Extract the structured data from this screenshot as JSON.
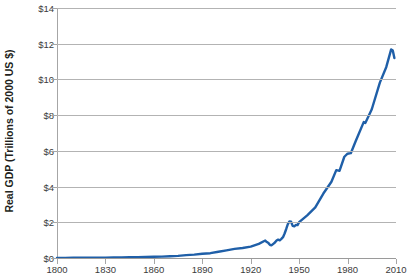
{
  "chart_data": {
    "type": "line",
    "title": "",
    "xlabel": "",
    "ylabel": "Real GDP (Trillions of 2000 US $)",
    "xlim": [
      1800,
      2010
    ],
    "ylim": [
      0,
      14
    ],
    "grid": true,
    "legend": "none",
    "line_color": "#1f5fa8",
    "gridline_color": "#b3b3b3",
    "axis_color": "#a6a6a6",
    "y_ticks": [
      0,
      2,
      4,
      6,
      8,
      10,
      12,
      14
    ],
    "y_tick_labels": [
      "$0",
      "$2",
      "$4",
      "$6",
      "$8",
      "$10",
      "$12",
      "$14"
    ],
    "x_ticks": [
      1800,
      1830,
      1860,
      1890,
      1920,
      1950,
      1980,
      2010
    ],
    "x_tick_labels": [
      "1800",
      "1830",
      "1860",
      "1890",
      "1920",
      "1950",
      "1980",
      "2010"
    ],
    "series": [
      {
        "name": "Real GDP",
        "units": "Trillions of 2000 US $",
        "x": [
          1800,
          1805,
          1810,
          1815,
          1820,
          1825,
          1830,
          1835,
          1840,
          1845,
          1850,
          1855,
          1860,
          1865,
          1870,
          1875,
          1880,
          1885,
          1890,
          1895,
          1900,
          1905,
          1910,
          1915,
          1920,
          1925,
          1929,
          1930,
          1931,
          1932,
          1933,
          1934,
          1935,
          1936,
          1937,
          1938,
          1939,
          1940,
          1941,
          1942,
          1943,
          1944,
          1945,
          1946,
          1947,
          1948,
          1949,
          1950,
          1955,
          1960,
          1965,
          1970,
          1973,
          1975,
          1978,
          1980,
          1982,
          1985,
          1990,
          1991,
          1995,
          2000,
          2004,
          2007,
          2008,
          2009
        ],
        "y": [
          0.006,
          0.008,
          0.01,
          0.012,
          0.014,
          0.017,
          0.021,
          0.026,
          0.032,
          0.039,
          0.048,
          0.058,
          0.07,
          0.078,
          0.098,
          0.12,
          0.16,
          0.19,
          0.24,
          0.27,
          0.35,
          0.43,
          0.51,
          0.56,
          0.64,
          0.79,
          0.977,
          0.892,
          0.834,
          0.725,
          0.716,
          0.794,
          0.865,
          0.978,
          1.028,
          0.992,
          1.073,
          1.167,
          1.372,
          1.625,
          1.899,
          2.05,
          2.03,
          1.8,
          1.776,
          1.854,
          1.84,
          2.006,
          2.39,
          2.83,
          3.61,
          4.27,
          4.92,
          4.88,
          5.67,
          5.84,
          5.87,
          6.54,
          7.61,
          7.56,
          8.33,
          9.82,
          10.7,
          11.68,
          11.62,
          11.2
        ]
      }
    ],
    "annotations": []
  },
  "axis": {
    "y_title": "Real GDP (Trillions of 2000 US $)"
  }
}
